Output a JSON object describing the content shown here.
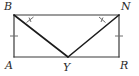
{
  "figure": {
    "type": "geometry-diagram",
    "canvas": {
      "width": 139,
      "height": 76
    },
    "colors": {
      "background": "#ffffff",
      "stroke": "#3a3a3a",
      "diagonal_stroke": "#1c1c1c",
      "tick_stroke": "#6e6e6e",
      "label_text": "#2b2b2b"
    },
    "stroke_widths": {
      "rectangle": 1.2,
      "diagonal": 1.6,
      "tick": 1.0
    },
    "vertices": [
      {
        "id": "B",
        "label": "B",
        "x": 14,
        "y": 15,
        "label_x": 4,
        "label_y": 1
      },
      {
        "id": "N",
        "label": "N",
        "x": 119,
        "y": 15,
        "label_x": 121,
        "label_y": 1
      },
      {
        "id": "A",
        "label": "A",
        "x": 14,
        "y": 57,
        "label_x": 5,
        "label_y": 60
      },
      {
        "id": "R",
        "label": "R",
        "x": 119,
        "y": 57,
        "label_x": 120,
        "label_y": 60
      },
      {
        "id": "Y",
        "label": "Y",
        "x": 68,
        "y": 57,
        "label_x": 63,
        "label_y": 62
      }
    ],
    "edges": [
      {
        "id": "BN",
        "name": "top-edge",
        "from": "B",
        "to": "N"
      },
      {
        "id": "NR",
        "name": "right-edge",
        "from": "N",
        "to": "R"
      },
      {
        "id": "AR",
        "name": "bottom-edge",
        "from": "A",
        "to": "R"
      },
      {
        "id": "AB",
        "name": "left-edge",
        "from": "A",
        "to": "B"
      },
      {
        "id": "BY",
        "name": "diagonal-b-y",
        "from": "B",
        "to": "Y"
      },
      {
        "id": "NY",
        "name": "diagonal-n-y",
        "from": "N",
        "to": "Y"
      }
    ],
    "angle_marks": [
      {
        "id": "angle-B",
        "at": "B",
        "between": [
          "BN",
          "BY"
        ],
        "ticks": 1
      },
      {
        "id": "angle-N",
        "at": "N",
        "between": [
          "BN",
          "NY"
        ],
        "ticks": 1
      }
    ],
    "side_marks": [
      {
        "id": "tick-AB",
        "on": "AB",
        "ticks": 1,
        "x": 14,
        "y": 36
      },
      {
        "id": "tick-NR",
        "on": "NR",
        "ticks": 1,
        "x": 119,
        "y": 36
      }
    ]
  }
}
